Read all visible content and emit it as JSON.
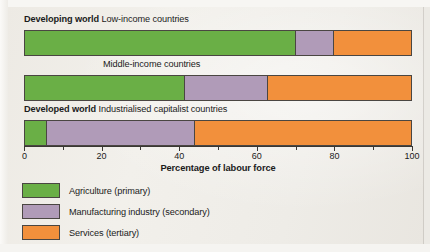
{
  "chart_data": {
    "type": "bar",
    "orientation": "horizontal",
    "stacked": true,
    "title": "",
    "xlabel": "Percentage of labour force",
    "ylabel": "",
    "xlim": [
      0,
      100
    ],
    "xticks": [
      0,
      20,
      40,
      60,
      80,
      100
    ],
    "xtick_labels": [
      "0",
      "20",
      "40",
      "60",
      "80",
      "100"
    ],
    "minor_ticks": [
      10,
      30,
      50,
      70,
      90
    ],
    "grid": false,
    "legend_position": "below-left",
    "categories": [
      "Low-income countries",
      "Middle-income countries",
      "Industrialised capitalist countries"
    ],
    "series": [
      {
        "name": "Agriculture (primary)",
        "color": "#6aaf46",
        "values": [
          70,
          41.5,
          6
        ]
      },
      {
        "name": "Manufacturing industry (secondary)",
        "color": "#b09bb8",
        "values": [
          10,
          21.5,
          38
        ]
      },
      {
        "name": "Services (tertiary)",
        "color": "#f2903c",
        "values": [
          20,
          37,
          56
        ]
      }
    ]
  },
  "rows": [
    {
      "group": "Developing world",
      "name": "Low-income countries",
      "label_align": "left"
    },
    {
      "group": "",
      "name": "Middle-income countries",
      "label_align": "center"
    },
    {
      "group": "Developed world",
      "name": "Industrialised capitalist countries",
      "label_align": "left"
    }
  ],
  "axis": {
    "title": "Percentage of labour force",
    "tick_labels": [
      "0",
      "20",
      "40",
      "60",
      "80",
      "100"
    ]
  },
  "legend": {
    "items": [
      {
        "label": "Agriculture (primary)",
        "key": "agriculture"
      },
      {
        "label": "Manufacturing industry (secondary)",
        "key": "manufacturing"
      },
      {
        "label": "Services (tertiary)",
        "key": "services"
      }
    ]
  },
  "colors": {
    "agriculture": "#6aaf46",
    "manufacturing": "#b09bb8",
    "services": "#f2903c",
    "outline": "#4a4642",
    "paper": "#efece7"
  }
}
